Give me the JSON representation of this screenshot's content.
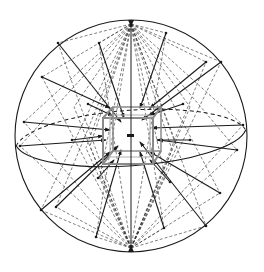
{
  "diagram": {
    "title": "",
    "colors": {
      "background": "#ffffff",
      "stroke": "#1a1a1a",
      "dashed": "#2a2a2a",
      "cube": "#8a8a8a"
    },
    "elements": {
      "sphere": "outer-sphere",
      "equator": "equatorial-ellipse",
      "cube": "central-cube",
      "poles": [
        "north-pole",
        "south-pole"
      ],
      "center": "center-point"
    }
  }
}
